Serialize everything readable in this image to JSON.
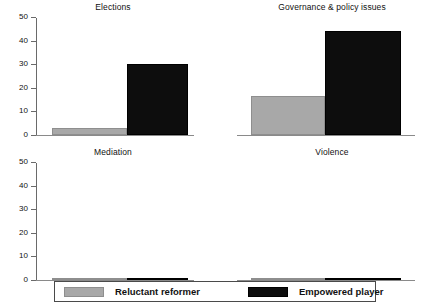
{
  "chart_data": {
    "type": "bar",
    "title": "",
    "layout": {
      "rows": 2,
      "cols": 2,
      "legend_position": "bottom",
      "grid": false,
      "shared_y_axis": true
    },
    "ylim": [
      0,
      50
    ],
    "yticks": [
      0,
      10,
      20,
      30,
      40,
      50
    ],
    "ytick_labels": [
      "0",
      "10",
      "20",
      "30",
      "40",
      "50"
    ],
    "xlabel": "",
    "ylabel": "",
    "categories": [
      "Elections",
      "Governance & policy issues",
      "Mediation",
      "Violence"
    ],
    "series": [
      {
        "name": "Reluctant reformer",
        "color": "#a8a8a8",
        "values": [
          3,
          16.5,
          1,
          0.7
        ]
      },
      {
        "name": "Empowered player",
        "color": "#0d0d0d",
        "values": [
          30.5,
          44.5,
          1,
          0.7
        ]
      }
    ],
    "panels": [
      {
        "title": "Elections",
        "row": 0,
        "col": 0,
        "bars": [
          {
            "series": "Reluctant reformer",
            "value": 3
          },
          {
            "series": "Empowered player",
            "value": 30.5
          }
        ]
      },
      {
        "title": "Governance & policy issues",
        "row": 0,
        "col": 1,
        "bars": [
          {
            "series": "Reluctant reformer",
            "value": 16.5
          },
          {
            "series": "Empowered player",
            "value": 44.5
          }
        ]
      },
      {
        "title": "Mediation",
        "row": 1,
        "col": 0,
        "bars": [
          {
            "series": "Reluctant reformer",
            "value": 1
          },
          {
            "series": "Empowered player",
            "value": 1
          }
        ]
      },
      {
        "title": "Violence",
        "row": 1,
        "col": 1,
        "bars": [
          {
            "series": "Reluctant reformer",
            "value": 0.7
          },
          {
            "series": "Empowered player",
            "value": 0.7
          }
        ]
      }
    ]
  },
  "legend": {
    "entries": [
      {
        "label": "Reluctant reformer",
        "color": "#a8a8a8"
      },
      {
        "label": "Empowered player",
        "color": "#0d0d0d"
      }
    ]
  }
}
